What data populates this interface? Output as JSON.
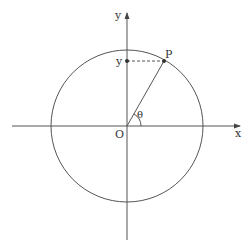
{
  "diagram": {
    "type": "unit-circle",
    "labels": {
      "x_axis": "x",
      "y_axis": "y",
      "origin": "O",
      "point": "P",
      "y_projection": "y",
      "angle": "θ"
    },
    "colors": {
      "stroke": "#555555",
      "text": "#333333",
      "background": "#ffffff"
    }
  }
}
